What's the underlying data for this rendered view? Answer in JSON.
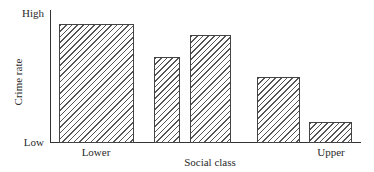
{
  "chart_data": {
    "type": "bar",
    "title": "",
    "xlabel": "Social class",
    "ylabel": "Crime rate",
    "y_tick_labels": [
      "Low",
      "High"
    ],
    "x_tick_labels": [
      {
        "label": "Lower",
        "position": "left"
      },
      {
        "label": "Upper",
        "position": "right"
      }
    ],
    "categories": [
      "Lower",
      "",
      "",
      "",
      "Upper"
    ],
    "values": [
      9.1,
      6.5,
      8.2,
      5.0,
      1.5
    ],
    "ylim": [
      0,
      10
    ],
    "value_scale_note": "Relative scale, Low=0 to High=10 (no numeric ticks shown)",
    "fill": "diagonal hatch",
    "grid": false,
    "legend": null
  },
  "labels": {
    "high": "High",
    "low": "Low",
    "y_axis": "Crime rate",
    "x_axis": "Social class",
    "lower": "Lower",
    "upper": "Upper"
  }
}
